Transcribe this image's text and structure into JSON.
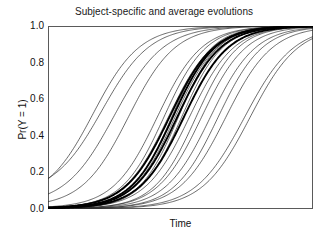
{
  "chart_data": {
    "type": "line",
    "title": "Subject-specific and average evolutions",
    "xlabel": "Time",
    "ylabel": "Pr(Y = 1)",
    "grid": false,
    "legend": null,
    "xlim": [
      0,
      12
    ],
    "ylim": [
      0,
      1
    ],
    "ytick_labels": [
      "0.0",
      "0.2",
      "0.4",
      "0.6",
      "0.8",
      "1.0"
    ],
    "ytick_values": [
      0.0,
      0.2,
      0.4,
      0.6,
      0.8,
      1.0
    ],
    "xtick_labels": [
      "",
      "",
      "",
      "",
      "",
      "",
      "",
      "",
      "",
      "",
      "",
      "",
      ""
    ],
    "xtick_values": [
      0,
      1,
      2,
      3,
      4,
      5,
      6,
      7,
      8,
      9,
      10,
      11,
      12
    ],
    "x": [
      0,
      0.5,
      1,
      1.5,
      2,
      2.5,
      3,
      3.5,
      4,
      4.5,
      5,
      5.5,
      6,
      6.5,
      7,
      7.5,
      8,
      8.5,
      9,
      9.5,
      10,
      10.5,
      11,
      11.5,
      12
    ],
    "series": [
      {
        "name": "subject-1",
        "style": "thin",
        "midpoint": 2.05,
        "slope": 0.95,
        "floor": 0.045
      },
      {
        "name": "subject-2",
        "style": "thin",
        "midpoint": 2.45,
        "slope": 0.92,
        "floor": 0.08
      },
      {
        "name": "subject-3",
        "style": "thin",
        "midpoint": 3.0,
        "slope": 0.9,
        "floor": 0.02
      },
      {
        "name": "subject-4",
        "style": "thin",
        "midpoint": 3.65,
        "slope": 0.95,
        "floor": 0.01
      },
      {
        "name": "subject-5",
        "style": "thin",
        "midpoint": 4.95,
        "slope": 1.0,
        "floor": 0.005
      },
      {
        "name": "subject-6",
        "style": "thin",
        "midpoint": 5.25,
        "slope": 1.05,
        "floor": 0.005
      },
      {
        "name": "subject-7",
        "style": "thin",
        "midpoint": 5.45,
        "slope": 1.0,
        "floor": 0.004
      },
      {
        "name": "subject-8",
        "style": "thin",
        "midpoint": 5.6,
        "slope": 1.1,
        "floor": 0.004
      },
      {
        "name": "subject-9",
        "style": "thin",
        "midpoint": 5.75,
        "slope": 1.05,
        "floor": 0.003
      },
      {
        "name": "subject-10",
        "style": "thin",
        "midpoint": 5.9,
        "slope": 1.12,
        "floor": 0.003
      },
      {
        "name": "subject-11",
        "style": "thin",
        "midpoint": 6.05,
        "slope": 1.08,
        "floor": 0.003
      },
      {
        "name": "subject-12",
        "style": "thin",
        "midpoint": 6.4,
        "slope": 1.0,
        "floor": 0.003
      },
      {
        "name": "subject-13",
        "style": "thin",
        "midpoint": 6.7,
        "slope": 1.05,
        "floor": 0.002
      },
      {
        "name": "subject-14",
        "style": "thin",
        "midpoint": 6.95,
        "slope": 1.0,
        "floor": 0.002
      },
      {
        "name": "subject-15",
        "style": "thin",
        "midpoint": 7.35,
        "slope": 0.98,
        "floor": 0.002
      },
      {
        "name": "subject-16",
        "style": "thin",
        "midpoint": 7.7,
        "slope": 1.0,
        "floor": 0.002
      },
      {
        "name": "subject-17",
        "style": "thin",
        "midpoint": 8.05,
        "slope": 0.95,
        "floor": 0.002
      },
      {
        "name": "subject-18",
        "style": "thin",
        "midpoint": 8.9,
        "slope": 0.9,
        "floor": 0.002
      },
      {
        "name": "subject-19",
        "style": "thin",
        "midpoint": 9.15,
        "slope": 0.92,
        "floor": 0.002
      },
      {
        "name": "average-1",
        "style": "bold",
        "midpoint": 5.5,
        "slope": 1.0,
        "floor": 0.004
      },
      {
        "name": "average-2",
        "style": "bold",
        "midpoint": 5.65,
        "slope": 1.05,
        "floor": 0.004
      },
      {
        "name": "average-3",
        "style": "bold",
        "midpoint": 5.85,
        "slope": 1.02,
        "floor": 0.003
      },
      {
        "name": "average-4",
        "style": "bold",
        "midpoint": 6.15,
        "slope": 1.0,
        "floor": 0.003
      }
    ]
  }
}
